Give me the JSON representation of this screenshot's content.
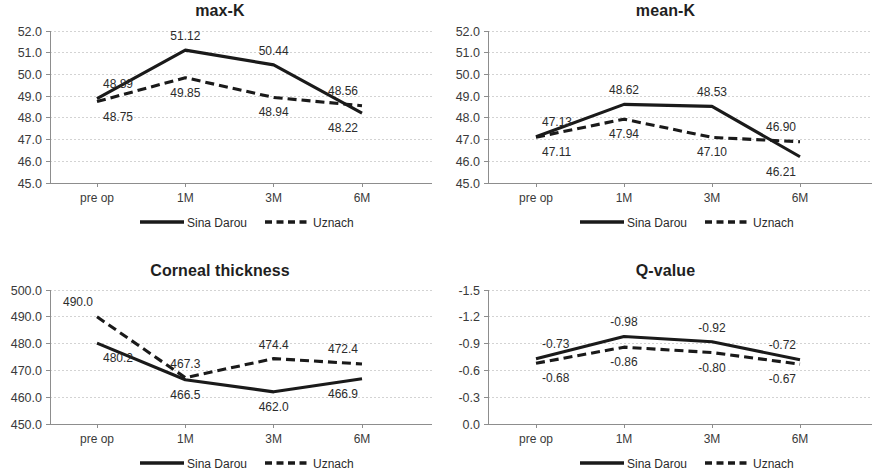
{
  "figure": {
    "panel_count": 4,
    "series_names": [
      "Sina Darou",
      "Uznach"
    ],
    "categories": [
      "pre op",
      "1M",
      "3M",
      "6M"
    ],
    "legend": {
      "solid_label": "Sina Darou",
      "dashed_label": "Uznach"
    },
    "colors": {
      "line": "#1a1a1a",
      "gridline": "#c8c8c8",
      "axis": "#8d8d8d",
      "text": "#2b2b2b",
      "background": "#ffffff"
    }
  },
  "chart_data": [
    {
      "type": "line",
      "title": "max-K",
      "xlabel": "",
      "ylabel": "",
      "categories": [
        "pre op",
        "1M",
        "3M",
        "6M"
      ],
      "ylim": [
        45.0,
        52.0
      ],
      "ytick_step": 1.0,
      "ytick_labels": [
        "52.0",
        "51.0",
        "50.0",
        "49.0",
        "48.0",
        "47.0",
        "46.0",
        "45.0"
      ],
      "ytick_values": [
        52.0,
        51.0,
        50.0,
        49.0,
        48.0,
        47.0,
        46.0,
        45.0
      ],
      "grid": true,
      "y_inverted": false,
      "legend_position": "bottom-center",
      "series": [
        {
          "name": "Sina Darou",
          "style": "solid",
          "values": [
            48.89,
            51.12,
            50.44,
            48.22
          ],
          "labels": [
            "48.89",
            "51.12",
            "50.44",
            "48.22"
          ],
          "label_positions": [
            "above-left",
            "above",
            "above",
            "below-right"
          ]
        },
        {
          "name": "Uznach",
          "style": "dashed",
          "values": [
            48.75,
            49.85,
            48.94,
            48.56
          ],
          "labels": [
            "48.75",
            "49.85",
            "48.94",
            "48.56"
          ],
          "label_positions": [
            "below-left",
            "below",
            "below",
            "above-right"
          ]
        }
      ]
    },
    {
      "type": "line",
      "title": "mean-K",
      "xlabel": "",
      "ylabel": "",
      "categories": [
        "pre op",
        "1M",
        "3M",
        "6M"
      ],
      "ylim": [
        45.0,
        52.0
      ],
      "ytick_step": 1.0,
      "ytick_labels": [
        "52.0",
        "51.0",
        "50.0",
        "49.0",
        "48.0",
        "47.0",
        "46.0",
        "45.0"
      ],
      "ytick_values": [
        52.0,
        51.0,
        50.0,
        49.0,
        48.0,
        47.0,
        46.0,
        45.0
      ],
      "grid": true,
      "y_inverted": false,
      "legend_position": "bottom-center",
      "series": [
        {
          "name": "Sina Darou",
          "style": "solid",
          "values": [
            47.13,
            48.62,
            48.53,
            46.21
          ],
          "labels": [
            "47.13",
            "48.62",
            "48.53",
            "46.21"
          ],
          "label_positions": [
            "above-left",
            "above",
            "above",
            "below-right"
          ]
        },
        {
          "name": "Uznach",
          "style": "dashed",
          "values": [
            47.11,
            47.94,
            47.1,
            46.9
          ],
          "labels": [
            "47.11",
            "47.94",
            "47.10",
            "46.90"
          ],
          "label_positions": [
            "below-left",
            "below",
            "below",
            "above-right"
          ]
        }
      ]
    },
    {
      "type": "line",
      "title": "Corneal thickness",
      "xlabel": "",
      "ylabel": "",
      "categories": [
        "pre op",
        "1M",
        "3M",
        "6M"
      ],
      "ylim": [
        450.0,
        500.0
      ],
      "ytick_step": 10.0,
      "ytick_labels": [
        "500.0",
        "490.0",
        "480.0",
        "470.0",
        "460.0",
        "450.0"
      ],
      "ytick_values": [
        500.0,
        490.0,
        480.0,
        470.0,
        460.0,
        450.0
      ],
      "grid": true,
      "y_inverted": false,
      "legend_position": "bottom-center",
      "series": [
        {
          "name": "Sina Darou",
          "style": "solid",
          "values": [
            480.2,
            466.5,
            462.0,
            466.9
          ],
          "labels": [
            "480.2",
            "466.5",
            "462.0",
            "466.9"
          ],
          "label_positions": [
            "below-left",
            "below",
            "below",
            "below-right"
          ]
        },
        {
          "name": "Uznach",
          "style": "dashed",
          "values": [
            490.0,
            467.3,
            474.4,
            472.4
          ],
          "labels": [
            "490.0",
            "467.3",
            "474.4",
            "472.4"
          ],
          "label_positions": [
            "above-right",
            "above",
            "above",
            "above-right"
          ]
        }
      ]
    },
    {
      "type": "line",
      "title": "Q-value",
      "xlabel": "",
      "ylabel": "",
      "categories": [
        "pre op",
        "1M",
        "3M",
        "6M"
      ],
      "ylim": [
        -1.5,
        0.0
      ],
      "ytick_step": 0.3,
      "ytick_labels": [
        "-1.5",
        "-1.2",
        "-0.9",
        "-0.6",
        "-0.3",
        "0.0"
      ],
      "ytick_values": [
        -1.5,
        -1.2,
        -0.9,
        -0.6,
        -0.3,
        0.0
      ],
      "grid": true,
      "y_inverted": true,
      "legend_position": "bottom-center",
      "series": [
        {
          "name": "Sina Darou",
          "style": "solid",
          "values": [
            -0.73,
            -0.98,
            -0.92,
            -0.72
          ],
          "labels": [
            "-0.73",
            "-0.98",
            "-0.92",
            "-0.72"
          ],
          "label_positions": [
            "above-left",
            "above",
            "above",
            "above-right"
          ]
        },
        {
          "name": "Uznach",
          "style": "dashed",
          "values": [
            -0.68,
            -0.86,
            -0.8,
            -0.67
          ],
          "labels": [
            "-0.68",
            "-0.86",
            "-0.80",
            "-0.67"
          ],
          "label_positions": [
            "below-left",
            "below",
            "below",
            "below-right"
          ]
        }
      ]
    }
  ]
}
